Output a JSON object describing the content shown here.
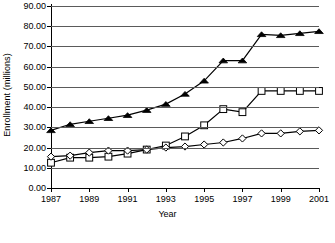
{
  "chart_data": {
    "type": "line",
    "title": "",
    "xlabel": "Year",
    "ylabel": "Enrollment (millions)",
    "x": [
      1987,
      1988,
      1989,
      1990,
      1991,
      1992,
      1993,
      1994,
      1995,
      1996,
      1997,
      1998,
      1999,
      2000,
      2001
    ],
    "xlim": [
      1987,
      2001
    ],
    "ylim": [
      0,
      90
    ],
    "ytick_labels": [
      "90.00",
      "80.00",
      "70.00",
      "60.00",
      "50.00",
      "40.00",
      "30.00",
      "20.00",
      "10.00",
      "0.00"
    ],
    "ytick_values": [
      90,
      80,
      70,
      60,
      50,
      40,
      30,
      20,
      10,
      0
    ],
    "xtick_labels": [
      "1987",
      "1989",
      "1991",
      "1993",
      "1995",
      "1997",
      "1999",
      "2001"
    ],
    "xtick_values": [
      1987,
      1989,
      1991,
      1993,
      1995,
      1997,
      1999,
      2001
    ],
    "grid": true,
    "legend_position": "bottom",
    "series": [
      {
        "name": "series-triangle",
        "marker": "filled-triangle",
        "color": "#000000",
        "values": [
          28.5,
          31.5,
          33.0,
          34.5,
          36.0,
          38.5,
          41.5,
          46.5,
          53.0,
          63.0,
          63.0,
          76.0,
          75.5,
          76.5,
          77.5
        ]
      },
      {
        "name": "series-square",
        "marker": "open-square",
        "color": "#000000",
        "values": [
          12.5,
          15.0,
          15.0,
          15.5,
          17.0,
          19.0,
          21.0,
          25.5,
          31.0,
          39.0,
          37.5,
          48.0,
          48.0,
          48.0,
          48.0
        ]
      },
      {
        "name": "series-diamond",
        "marker": "open-diamond",
        "color": "#000000",
        "values": [
          15.5,
          16.0,
          17.5,
          18.5,
          18.5,
          19.0,
          20.0,
          20.5,
          21.5,
          22.5,
          24.5,
          27.0,
          27.0,
          28.0,
          28.5
        ]
      }
    ]
  },
  "legend": {
    "entries": [
      {
        "label": ""
      },
      {
        "label": ""
      },
      {
        "label": ""
      }
    ]
  }
}
